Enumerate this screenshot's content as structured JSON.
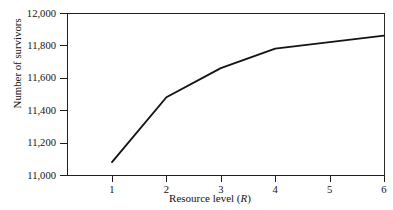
{
  "chart_data": {
    "type": "line",
    "title": "",
    "xlabel": "Resource level (R)",
    "xlabel_plain": "Resource level",
    "xlabel_variable": "R",
    "ylabel": "Number of survivors",
    "x": [
      1,
      2,
      3,
      4,
      6
    ],
    "values": [
      11080,
      11480,
      11660,
      11780,
      11860
    ],
    "series": [
      {
        "name": "survivors",
        "x": [
          1,
          2,
          3,
          4,
          6
        ],
        "values": [
          11080,
          11480,
          11660,
          11780,
          11860
        ]
      }
    ],
    "xlim": [
      0.62,
      6.0
    ],
    "ylim": [
      11000,
      12000
    ],
    "xticks": [
      1,
      2,
      3,
      4,
      5,
      6
    ],
    "xtick_labels": [
      "1",
      "2",
      "3",
      "4",
      "5",
      "6"
    ],
    "yticks": [
      11000,
      11200,
      11400,
      11600,
      11800,
      12000
    ],
    "ytick_labels": [
      "11,000",
      "11,200",
      "11,400",
      "11,600",
      "11,800",
      "12,000"
    ],
    "grid": false,
    "legend": false,
    "legend_position": "none",
    "line_color": "#141414",
    "frame_color": "#202020",
    "background": "#ffffff"
  },
  "figure": {
    "y_axis_title": "Number of survivors",
    "x_axis_title_prefix": "Resource level (",
    "x_axis_title_variable": "R",
    "x_axis_title_suffix": ")"
  }
}
